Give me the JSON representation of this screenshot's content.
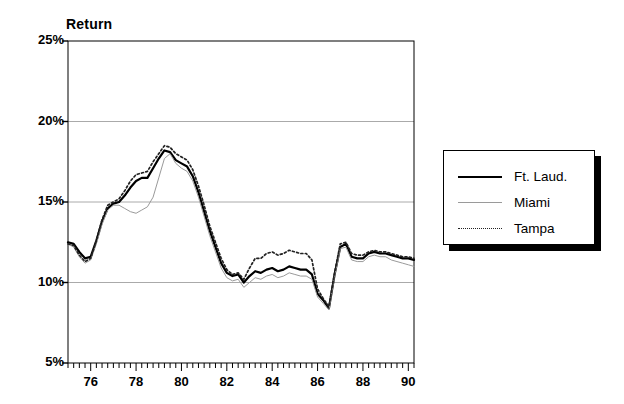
{
  "chart_data": {
    "type": "line",
    "title": "",
    "ylabel": "Return",
    "xlabel": "",
    "ylim": [
      5,
      25
    ],
    "xlim": [
      1975.0,
      1990.25
    ],
    "y_ticks": [
      5,
      10,
      15,
      20,
      25
    ],
    "y_tick_labels": [
      "5%",
      "10%",
      "15%",
      "20%",
      "25%"
    ],
    "x_ticks": [
      76,
      78,
      80,
      82,
      84,
      86,
      88,
      90
    ],
    "x_tick_labels": [
      "76",
      "78",
      "80",
      "82",
      "84",
      "86",
      "88",
      "90"
    ],
    "x_minor_tick_interval": 0.25,
    "grid": "horizontal",
    "legend_position": "right-outside",
    "x": [
      1975.0,
      1975.25,
      1975.5,
      1975.75,
      1976.0,
      1976.25,
      1976.5,
      1976.75,
      1977.0,
      1977.25,
      1977.5,
      1977.75,
      1978.0,
      1978.25,
      1978.5,
      1978.75,
      1979.0,
      1979.25,
      1979.5,
      1979.75,
      1980.0,
      1980.25,
      1980.5,
      1980.75,
      1981.0,
      1981.25,
      1981.5,
      1981.75,
      1982.0,
      1982.25,
      1982.5,
      1982.75,
      1983.0,
      1983.25,
      1983.5,
      1983.75,
      1984.0,
      1984.25,
      1984.5,
      1984.75,
      1985.0,
      1985.25,
      1985.5,
      1985.75,
      1986.0,
      1986.25,
      1986.5,
      1986.75,
      1987.0,
      1987.25,
      1987.5,
      1987.75,
      1988.0,
      1988.25,
      1988.5,
      1988.75,
      1989.0,
      1989.25,
      1989.5,
      1989.75,
      1990.0,
      1990.25
    ],
    "series": [
      {
        "name": "Ft. Laud.",
        "style": "solid-thick",
        "color": "#000000",
        "values": [
          12.5,
          12.4,
          11.9,
          11.5,
          11.6,
          12.6,
          13.8,
          14.6,
          14.9,
          15.0,
          15.4,
          15.9,
          16.3,
          16.5,
          16.5,
          17.1,
          17.7,
          18.2,
          18.1,
          17.6,
          17.4,
          17.2,
          16.6,
          15.6,
          14.4,
          13.2,
          12.2,
          11.2,
          10.6,
          10.4,
          10.5,
          10.0,
          10.4,
          10.7,
          10.6,
          10.8,
          10.9,
          10.7,
          10.8,
          11.0,
          10.9,
          10.8,
          10.8,
          10.5,
          9.3,
          8.9,
          8.4,
          10.5,
          12.2,
          12.4,
          11.6,
          11.5,
          11.5,
          11.8,
          11.9,
          11.8,
          11.8,
          11.7,
          11.6,
          11.5,
          11.5,
          11.4
        ]
      },
      {
        "name": "Miami",
        "style": "solid-thin",
        "color": "#9a9a9a",
        "values": [
          12.4,
          12.2,
          11.6,
          11.2,
          11.4,
          12.4,
          13.6,
          14.5,
          14.8,
          14.8,
          14.6,
          14.4,
          14.3,
          14.5,
          14.7,
          15.3,
          16.5,
          17.7,
          18.0,
          17.4,
          17.1,
          16.9,
          16.3,
          15.3,
          14.1,
          12.9,
          11.9,
          10.9,
          10.3,
          10.1,
          10.2,
          9.7,
          10.0,
          10.3,
          10.2,
          10.4,
          10.5,
          10.3,
          10.4,
          10.6,
          10.5,
          10.4,
          10.4,
          10.2,
          9.1,
          8.7,
          8.3,
          10.4,
          12.1,
          12.2,
          11.4,
          11.3,
          11.3,
          11.6,
          11.7,
          11.6,
          11.6,
          11.4,
          11.3,
          11.2,
          11.1,
          11.0
        ]
      },
      {
        "name": "Tampa",
        "style": "dotted",
        "color": "#222222",
        "values": [
          12.4,
          12.3,
          11.7,
          11.3,
          11.5,
          12.6,
          13.9,
          14.8,
          15.0,
          15.2,
          15.7,
          16.3,
          16.7,
          16.8,
          16.9,
          17.5,
          18.0,
          18.5,
          18.4,
          18.0,
          17.8,
          17.6,
          17.0,
          16.0,
          14.8,
          13.5,
          12.5,
          11.5,
          10.8,
          10.5,
          10.6,
          10.2,
          10.9,
          11.5,
          11.5,
          11.8,
          11.9,
          11.7,
          11.8,
          12.0,
          11.9,
          11.8,
          11.8,
          11.4,
          9.6,
          9.0,
          8.5,
          10.6,
          12.4,
          12.5,
          11.8,
          11.7,
          11.7,
          11.9,
          12.0,
          11.9,
          11.9,
          11.8,
          11.7,
          11.6,
          11.6,
          11.5
        ]
      }
    ]
  },
  "axis": {
    "y_title": "Return"
  },
  "legend": {
    "entries": [
      {
        "label": "Ft. Laud."
      },
      {
        "label": "Miami"
      },
      {
        "label": "Tampa"
      }
    ]
  }
}
